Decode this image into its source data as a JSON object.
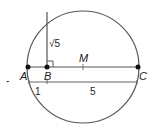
{
  "diagram": {
    "points": [
      {
        "name": "A",
        "x": 28,
        "y": 67
      },
      {
        "name": "B",
        "x": 47,
        "y": 67
      },
      {
        "name": "C",
        "x": 138,
        "y": 67
      }
    ],
    "midpoint_label": "M",
    "segment_labels": {
      "vertical": "√5",
      "AB": "1",
      "BC": "5"
    },
    "stray_mark": "-",
    "colors": {
      "stroke": "#555555",
      "point": "#111111"
    }
  }
}
